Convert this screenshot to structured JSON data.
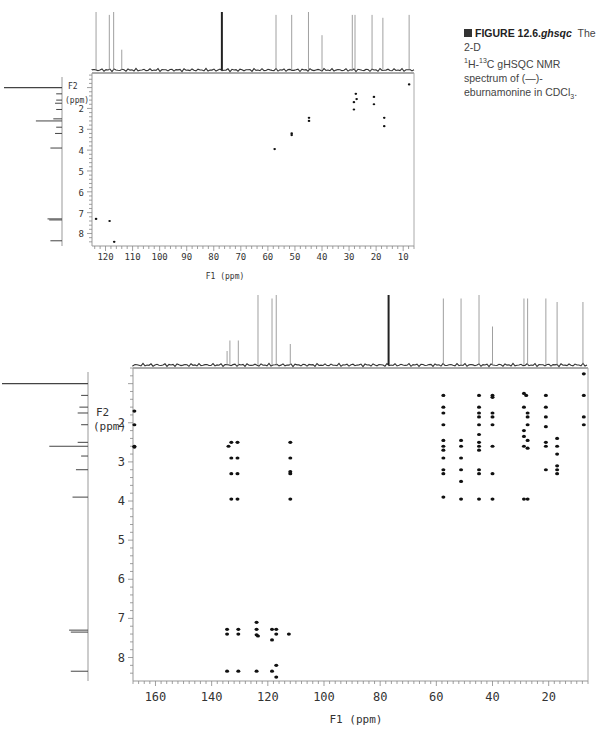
{
  "caption": {
    "figure_label": "FIGURE 12.6.",
    "figure_tag": "ghsqc",
    "text_part1": "The 2-D ",
    "text_part2": "H-",
    "text_part3": "C gHSQC NMR spectrum of (—)-eburnamonine in CDCl",
    "text_end": ".",
    "sup1": "1",
    "sup13": "13",
    "sub3": "3"
  },
  "chart_data": [
    {
      "type": "scatter",
      "title": "2-D 1H-13C gHSQC (full view)",
      "xlabel": "F1 (ppm)",
      "ylabel": "F2 (ppm)",
      "xlim": [
        125,
        6
      ],
      "ylim": [
        0.3,
        8.6
      ],
      "xticks": [
        120,
        110,
        100,
        90,
        80,
        70,
        60,
        50,
        40,
        30,
        20,
        10
      ],
      "yticks": [
        2,
        3,
        4,
        5,
        6,
        7,
        8
      ],
      "grid": false,
      "projection_13C_peaks": [
        {
          "ppm": 123.5,
          "h": 1.0
        },
        {
          "ppm": 118.6,
          "h": 0.95
        },
        {
          "ppm": 117.0,
          "h": 1.0
        },
        {
          "ppm": 114.0,
          "h": 0.35
        },
        {
          "ppm": 77.0,
          "h": 1.0
        },
        {
          "ppm": 57.0,
          "h": 0.95
        },
        {
          "ppm": 51.2,
          "h": 0.95
        },
        {
          "ppm": 45.0,
          "h": 1.0
        },
        {
          "ppm": 40.0,
          "h": 0.6
        },
        {
          "ppm": 28.8,
          "h": 0.95
        },
        {
          "ppm": 27.8,
          "h": 0.95
        },
        {
          "ppm": 21.5,
          "h": 0.95
        },
        {
          "ppm": 17.5,
          "h": 0.9
        },
        {
          "ppm": 7.8,
          "h": 0.95
        }
      ],
      "projection_1H_peaks": [
        {
          "ppm": 1.0,
          "h": 1.0
        },
        {
          "ppm": 1.3,
          "h": 0.1
        },
        {
          "ppm": 1.6,
          "h": 0.1
        },
        {
          "ppm": 1.75,
          "h": 0.12
        },
        {
          "ppm": 2.05,
          "h": 0.1
        },
        {
          "ppm": 2.5,
          "h": 0.15
        },
        {
          "ppm": 2.6,
          "h": 0.45
        },
        {
          "ppm": 2.9,
          "h": 0.1
        },
        {
          "ppm": 3.2,
          "h": 0.12
        },
        {
          "ppm": 3.9,
          "h": 0.2
        },
        {
          "ppm": 7.3,
          "h": 0.25
        },
        {
          "ppm": 7.35,
          "h": 0.22
        },
        {
          "ppm": 8.35,
          "h": 0.2
        }
      ],
      "cross_peaks": [
        {
          "f1": 123.5,
          "f2": 7.3
        },
        {
          "f1": 118.5,
          "f2": 7.4
        },
        {
          "f1": 116.8,
          "f2": 8.4
        },
        {
          "f1": 57.5,
          "f2": 3.95
        },
        {
          "f1": 51.2,
          "f2": 3.2
        },
        {
          "f1": 51.2,
          "f2": 3.28
        },
        {
          "f1": 44.8,
          "f2": 2.45
        },
        {
          "f1": 44.8,
          "f2": 2.6
        },
        {
          "f1": 28.2,
          "f2": 1.7
        },
        {
          "f1": 28.2,
          "f2": 2.05
        },
        {
          "f1": 27.5,
          "f2": 1.3
        },
        {
          "f1": 27.2,
          "f2": 1.55
        },
        {
          "f1": 20.8,
          "f2": 1.45
        },
        {
          "f1": 20.8,
          "f2": 1.8
        },
        {
          "f1": 17.0,
          "f2": 2.45
        },
        {
          "f1": 17.0,
          "f2": 2.85
        },
        {
          "f1": 7.8,
          "f2": 0.85
        }
      ]
    },
    {
      "type": "scatter",
      "title": "2-D 1H-13C gHSQC (expanded, heavier contour)",
      "xlabel": "F1 (ppm)",
      "ylabel": "F2 (ppm)",
      "xlim": [
        168,
        6
      ],
      "ylim": [
        0.6,
        8.6
      ],
      "xticks": [
        160,
        140,
        120,
        100,
        80,
        60,
        40,
        20
      ],
      "yticks": [
        2,
        3,
        4,
        5,
        6,
        7,
        8
      ],
      "grid": false,
      "projection_13C_peaks": [
        {
          "ppm": 134.5,
          "h": 0.2
        },
        {
          "ppm": 133.5,
          "h": 0.35
        },
        {
          "ppm": 130.5,
          "h": 0.35
        },
        {
          "ppm": 123.5,
          "h": 1.0
        },
        {
          "ppm": 118.5,
          "h": 0.95
        },
        {
          "ppm": 117.0,
          "h": 1.0
        },
        {
          "ppm": 112.0,
          "h": 0.3
        },
        {
          "ppm": 77.0,
          "h": 1.0
        },
        {
          "ppm": 57.5,
          "h": 0.95
        },
        {
          "ppm": 51.2,
          "h": 0.95
        },
        {
          "ppm": 44.8,
          "h": 1.0
        },
        {
          "ppm": 40.0,
          "h": 0.55
        },
        {
          "ppm": 28.8,
          "h": 0.95
        },
        {
          "ppm": 27.5,
          "h": 0.95
        },
        {
          "ppm": 21.0,
          "h": 0.95
        },
        {
          "ppm": 17.0,
          "h": 0.9
        },
        {
          "ppm": 7.8,
          "h": 0.9
        }
      ],
      "projection_1H_peaks": [
        {
          "ppm": 1.0,
          "h": 1.0
        },
        {
          "ppm": 1.3,
          "h": 0.08
        },
        {
          "ppm": 1.6,
          "h": 0.1
        },
        {
          "ppm": 1.75,
          "h": 0.12
        },
        {
          "ppm": 2.05,
          "h": 0.08
        },
        {
          "ppm": 2.5,
          "h": 0.12
        },
        {
          "ppm": 2.6,
          "h": 0.45
        },
        {
          "ppm": 2.85,
          "h": 0.08
        },
        {
          "ppm": 3.2,
          "h": 0.14
        },
        {
          "ppm": 3.9,
          "h": 0.18
        },
        {
          "ppm": 7.3,
          "h": 0.22
        },
        {
          "ppm": 7.35,
          "h": 0.2
        },
        {
          "ppm": 8.35,
          "h": 0.2
        }
      ],
      "cross_peaks": [
        {
          "f1": 167.5,
          "f2": 1.7
        },
        {
          "f1": 167.5,
          "f2": 2.05
        },
        {
          "f1": 167.5,
          "f2": 2.6
        },
        {
          "f1": 167.5,
          "f2": 2.62
        },
        {
          "f1": 134.0,
          "f2": 2.6
        },
        {
          "f1": 133.0,
          "f2": 2.5
        },
        {
          "f1": 130.8,
          "f2": 2.5
        },
        {
          "f1": 133.0,
          "f2": 2.9
        },
        {
          "f1": 130.8,
          "f2": 2.9
        },
        {
          "f1": 133.0,
          "f2": 3.3
        },
        {
          "f1": 130.8,
          "f2": 3.3
        },
        {
          "f1": 133.0,
          "f2": 3.95
        },
        {
          "f1": 130.8,
          "f2": 3.95
        },
        {
          "f1": 112.0,
          "f2": 2.5
        },
        {
          "f1": 112.0,
          "f2": 2.9
        },
        {
          "f1": 112.0,
          "f2": 3.25
        },
        {
          "f1": 112.0,
          "f2": 3.3
        },
        {
          "f1": 112.0,
          "f2": 3.95
        },
        {
          "f1": 134.5,
          "f2": 7.28
        },
        {
          "f1": 134.5,
          "f2": 7.4
        },
        {
          "f1": 130.5,
          "f2": 7.28
        },
        {
          "f1": 130.5,
          "f2": 7.4
        },
        {
          "f1": 124.0,
          "f2": 7.1
        },
        {
          "f1": 124.0,
          "f2": 7.28
        },
        {
          "f1": 124.0,
          "f2": 7.42
        },
        {
          "f1": 123.5,
          "f2": 7.45
        },
        {
          "f1": 118.5,
          "f2": 7.28
        },
        {
          "f1": 117.0,
          "f2": 7.28
        },
        {
          "f1": 118.5,
          "f2": 7.55
        },
        {
          "f1": 117.0,
          "f2": 7.4
        },
        {
          "f1": 112.5,
          "f2": 7.4
        },
        {
          "f1": 134.5,
          "f2": 8.35
        },
        {
          "f1": 130.5,
          "f2": 8.35
        },
        {
          "f1": 124.0,
          "f2": 8.35
        },
        {
          "f1": 118.5,
          "f2": 8.35
        },
        {
          "f1": 117.0,
          "f2": 8.2
        },
        {
          "f1": 117.0,
          "f2": 8.5
        },
        {
          "f1": 57.5,
          "f2": 1.3
        },
        {
          "f1": 57.5,
          "f2": 1.6
        },
        {
          "f1": 57.5,
          "f2": 1.75
        },
        {
          "f1": 57.5,
          "f2": 2.05
        },
        {
          "f1": 57.5,
          "f2": 2.45
        },
        {
          "f1": 57.5,
          "f2": 2.6
        },
        {
          "f1": 57.5,
          "f2": 2.7
        },
        {
          "f1": 57.5,
          "f2": 2.9
        },
        {
          "f1": 57.5,
          "f2": 3.2
        },
        {
          "f1": 57.5,
          "f2": 3.3
        },
        {
          "f1": 57.5,
          "f2": 3.9
        },
        {
          "f1": 51.2,
          "f2": 2.45
        },
        {
          "f1": 51.2,
          "f2": 2.6
        },
        {
          "f1": 51.2,
          "f2": 2.9
        },
        {
          "f1": 51.2,
          "f2": 3.2
        },
        {
          "f1": 51.2,
          "f2": 3.5
        },
        {
          "f1": 51.2,
          "f2": 3.95
        },
        {
          "f1": 44.8,
          "f2": 1.3
        },
        {
          "f1": 44.8,
          "f2": 1.6
        },
        {
          "f1": 44.8,
          "f2": 1.75
        },
        {
          "f1": 44.8,
          "f2": 1.85
        },
        {
          "f1": 44.8,
          "f2": 2.05
        },
        {
          "f1": 44.8,
          "f2": 2.3
        },
        {
          "f1": 44.8,
          "f2": 2.5
        },
        {
          "f1": 44.8,
          "f2": 2.6
        },
        {
          "f1": 44.8,
          "f2": 2.7
        },
        {
          "f1": 44.8,
          "f2": 3.2
        },
        {
          "f1": 44.8,
          "f2": 3.3
        },
        {
          "f1": 44.8,
          "f2": 3.95
        },
        {
          "f1": 40.0,
          "f2": 1.3
        },
        {
          "f1": 40.0,
          "f2": 1.35
        },
        {
          "f1": 40.0,
          "f2": 1.75
        },
        {
          "f1": 40.0,
          "f2": 1.85
        },
        {
          "f1": 40.0,
          "f2": 2.05
        },
        {
          "f1": 40.0,
          "f2": 2.6
        },
        {
          "f1": 40.0,
          "f2": 3.3
        },
        {
          "f1": 40.0,
          "f2": 3.95
        },
        {
          "f1": 28.8,
          "f2": 1.25
        },
        {
          "f1": 28.0,
          "f2": 1.3
        },
        {
          "f1": 28.8,
          "f2": 1.6
        },
        {
          "f1": 27.5,
          "f2": 1.75
        },
        {
          "f1": 27.5,
          "f2": 1.85
        },
        {
          "f1": 27.5,
          "f2": 2.05
        },
        {
          "f1": 28.8,
          "f2": 2.2
        },
        {
          "f1": 28.8,
          "f2": 2.35
        },
        {
          "f1": 27.5,
          "f2": 2.45
        },
        {
          "f1": 28.8,
          "f2": 2.6
        },
        {
          "f1": 27.5,
          "f2": 2.65
        },
        {
          "f1": 28.8,
          "f2": 3.95
        },
        {
          "f1": 27.5,
          "f2": 3.95
        },
        {
          "f1": 21.0,
          "f2": 1.3
        },
        {
          "f1": 21.0,
          "f2": 1.6
        },
        {
          "f1": 21.0,
          "f2": 1.85
        },
        {
          "f1": 21.0,
          "f2": 2.1
        },
        {
          "f1": 21.0,
          "f2": 2.5
        },
        {
          "f1": 21.0,
          "f2": 2.6
        },
        {
          "f1": 21.0,
          "f2": 3.2
        },
        {
          "f1": 17.0,
          "f2": 2.4
        },
        {
          "f1": 17.0,
          "f2": 2.6
        },
        {
          "f1": 17.0,
          "f2": 2.8
        },
        {
          "f1": 17.0,
          "f2": 3.1
        },
        {
          "f1": 17.0,
          "f2": 3.2
        },
        {
          "f1": 17.0,
          "f2": 3.3
        },
        {
          "f1": 7.5,
          "f2": 0.75
        },
        {
          "f1": 7.5,
          "f2": 1.3
        },
        {
          "f1": 7.5,
          "f2": 1.85
        },
        {
          "f1": 7.5,
          "f2": 2.05
        }
      ]
    }
  ],
  "axes_labels": {
    "f1": "F1 (ppm)",
    "f2_line1": "F2",
    "f2_line2": "(ppm)"
  }
}
